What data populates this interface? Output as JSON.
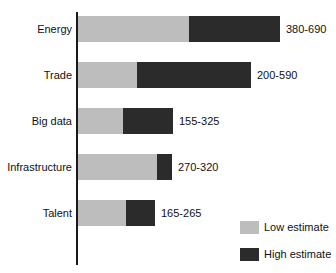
{
  "chart_data": {
    "type": "bar",
    "orientation": "horizontal",
    "stacked": false,
    "title": "",
    "xlabel": "",
    "ylabel": "",
    "grid": false,
    "legend_position": "bottom-right",
    "categories": [
      "Energy",
      "Trade",
      "Big data",
      "Infrastructure",
      "Talent"
    ],
    "series": [
      {
        "name": "Low estimate",
        "color": "#bdbdbd",
        "values": [
          380,
          200,
          155,
          270,
          165
        ]
      },
      {
        "name": "High estimate",
        "color": "#2b2b2b",
        "values": [
          690,
          590,
          325,
          320,
          265
        ]
      }
    ],
    "value_labels": [
      "380-690",
      "200-590",
      "155-325",
      "270-320",
      "165-265"
    ],
    "xlim": [
      0,
      690
    ],
    "px_per_unit": 0.2932,
    "rows": [
      {
        "category": "Energy",
        "low": 380,
        "high": 690,
        "label": "380-690",
        "top": 16
      },
      {
        "category": "Trade",
        "low": 200,
        "high": 590,
        "label": "200-590",
        "top": 62
      },
      {
        "category": "Big data",
        "low": 155,
        "high": 325,
        "label": "155-325",
        "top": 108
      },
      {
        "category": "Infrastructure",
        "low": 270,
        "high": 320,
        "label": "270-320",
        "top": 154
      },
      {
        "category": "Talent",
        "low": 165,
        "high": 265,
        "label": "165-265",
        "top": 200
      }
    ]
  },
  "legend": {
    "items": [
      {
        "label": "Low estimate",
        "swatch": "low"
      },
      {
        "label": "High estimate",
        "swatch": "high"
      }
    ]
  },
  "title_strip": {
    "text": ""
  }
}
